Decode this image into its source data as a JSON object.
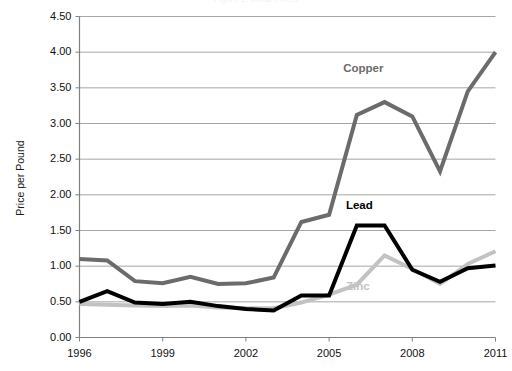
{
  "chart_data": {
    "type": "line",
    "title": "Figure 1. Metal Prices",
    "xlabel": "",
    "ylabel": "Price per Pound",
    "x": [
      1996,
      1997,
      1998,
      1999,
      2000,
      2001,
      2002,
      2003,
      2004,
      2005,
      2006,
      2007,
      2008,
      2009,
      2010,
      2011
    ],
    "xlim": [
      1996,
      2011
    ],
    "ylim": [
      0.0,
      4.5
    ],
    "ytick_labels": [
      "0.00",
      "0.50",
      "1.00",
      "1.50",
      "2.00",
      "2.50",
      "3.00",
      "3.50",
      "4.00",
      "4.50"
    ],
    "ytick_values": [
      0.0,
      0.5,
      1.0,
      1.5,
      2.0,
      2.5,
      3.0,
      3.5,
      4.0,
      4.5
    ],
    "xtick_labels": [
      "1996",
      "1999",
      "2002",
      "2005",
      "2008",
      "2011"
    ],
    "xtick_values": [
      1996,
      1999,
      2002,
      2005,
      2008,
      2011
    ],
    "grid": "horizontal",
    "legend_position": "inline-labels",
    "series": [
      {
        "name": "Copper",
        "color": "#6b6b6b",
        "width": 4,
        "label_x": 2006.3,
        "label_y": 3.78,
        "values": [
          1.1,
          1.08,
          0.79,
          0.76,
          0.85,
          0.75,
          0.76,
          0.84,
          1.62,
          1.72,
          3.12,
          3.3,
          3.1,
          2.33,
          3.45,
          4.0
        ]
      },
      {
        "name": "Lead",
        "color": "#000000",
        "width": 4,
        "label_x": 2006.4,
        "label_y": 1.86,
        "values": [
          0.5,
          0.65,
          0.49,
          0.47,
          0.5,
          0.44,
          0.4,
          0.38,
          0.59,
          0.59,
          1.57,
          1.57,
          0.95,
          0.78,
          0.97,
          1.01
        ]
      },
      {
        "name": "Zinc",
        "color": "#c2c2c2",
        "width": 4,
        "label_x": 2006.4,
        "label_y": 0.72,
        "values": [
          0.47,
          0.46,
          0.45,
          0.44,
          0.45,
          0.42,
          0.41,
          0.41,
          0.49,
          0.6,
          0.74,
          1.15,
          0.96,
          0.75,
          1.03,
          1.21
        ]
      }
    ]
  },
  "axes": {
    "spine_color": "#808080",
    "grid_color": "#a6a6a6",
    "tick_color": "#808080",
    "background": "#ffffff"
  }
}
